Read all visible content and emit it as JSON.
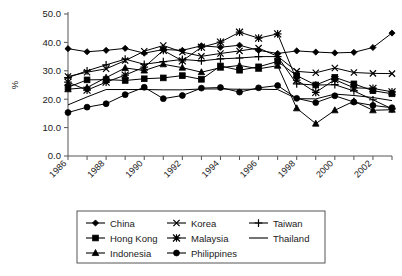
{
  "chart_data": {
    "type": "line",
    "title": "",
    "xlabel": "",
    "ylabel": "%",
    "ylim": [
      0.0,
      50.0
    ],
    "yticks": [
      "0.0",
      "10.0",
      "20.0",
      "30.0",
      "40.0",
      "50.0"
    ],
    "grid": false,
    "legend_position": "below",
    "x": [
      1986,
      1987,
      1988,
      1989,
      1990,
      1991,
      1992,
      1993,
      1994,
      1995,
      1996,
      1997,
      1998,
      1999,
      2000,
      2001,
      2002,
      2003
    ],
    "xtick_labels": [
      "1986",
      "1988",
      "1990",
      "1992",
      "1994",
      "1996",
      "1998",
      "2000",
      "2002"
    ],
    "xtick_values": [
      1986,
      1988,
      1990,
      1992,
      1994,
      1996,
      1998,
      2000,
      2002
    ],
    "series": [
      {
        "name": "China",
        "marker": "diamond",
        "values": [
          37.8,
          36.7,
          37.2,
          37.9,
          36.2,
          37.5,
          37.2,
          38.8,
          38.3,
          39.0,
          37.2,
          36.1,
          37.0,
          36.6,
          36.3,
          36.5,
          38.2,
          43.3
        ]
      },
      {
        "name": "Hong Kong",
        "marker": "square",
        "values": [
          24.2,
          26.8,
          26.9,
          26.6,
          27.2,
          27.5,
          28.3,
          27.0,
          31.7,
          30.2,
          31.4,
          33.3,
          28.3,
          25.0,
          27.7,
          25.4,
          23.0,
          21.9
        ]
      },
      {
        "name": "Indonesia",
        "marker": "triangle",
        "values": [
          23.5,
          24.1,
          27.6,
          31.0,
          30.1,
          32.3,
          31.1,
          29.5,
          31.1,
          31.9,
          30.7,
          31.8,
          16.8,
          11.4,
          16.1,
          19.3,
          16.1,
          16.3
        ]
      },
      {
        "name": "Korea",
        "marker": "x",
        "values": [
          28.0,
          29.5,
          30.7,
          33.6,
          36.9,
          38.9,
          36.6,
          35.1,
          36.1,
          37.0,
          38.0,
          35.1,
          29.8,
          29.3,
          31.0,
          29.4,
          29.1,
          29.0
        ]
      },
      {
        "name": "Malaysia",
        "marker": "asterisk",
        "values": [
          26.0,
          23.2,
          26.0,
          28.5,
          31.3,
          37.2,
          33.5,
          38.3,
          40.1,
          43.6,
          41.5,
          43.0,
          26.7,
          22.4,
          26.9,
          24.0,
          23.8,
          22.6
        ]
      },
      {
        "name": "Philippines",
        "marker": "circle",
        "values": [
          15.3,
          17.2,
          18.4,
          21.6,
          24.2,
          20.2,
          21.3,
          23.9,
          24.1,
          22.5,
          24.0,
          24.8,
          20.3,
          18.8,
          21.2,
          19.0,
          17.8,
          17.0
        ]
      },
      {
        "name": "Taiwan",
        "marker": "plus",
        "values": [
          27.6,
          30.0,
          32.1,
          34.1,
          32.3,
          33.2,
          34.0,
          33.5,
          34.2,
          34.5,
          35.0,
          35.0,
          25.4,
          25.0,
          25.1,
          22.9,
          19.8,
          16.6
        ]
      },
      {
        "name": "Thailand",
        "marker": "none",
        "values": [
          18.0,
          20.8,
          23.4,
          23.4,
          23.4,
          23.3,
          23.3,
          23.6,
          23.6,
          23.5,
          23.5,
          23.4,
          20.2,
          20.1,
          21.8,
          21.3,
          20.6,
          19.5
        ]
      }
    ]
  },
  "legend": {
    "columns": [
      [
        {
          "label": "China",
          "marker": "diamond"
        },
        {
          "label": "Hong Kong",
          "marker": "square"
        },
        {
          "label": "Indonesia",
          "marker": "triangle"
        }
      ],
      [
        {
          "label": "Korea",
          "marker": "x"
        },
        {
          "label": "Malaysia",
          "marker": "asterisk"
        },
        {
          "label": "Philippines",
          "marker": "circle"
        }
      ],
      [
        {
          "label": "Taiwan",
          "marker": "plus"
        },
        {
          "label": "Thailand",
          "marker": "none"
        }
      ]
    ]
  },
  "colors": {
    "series": "#000000",
    "axis": "#555555",
    "text": "#1a1a1a",
    "background": "#ffffff"
  }
}
